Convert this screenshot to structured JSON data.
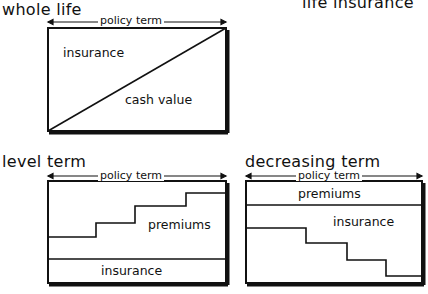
{
  "header": {
    "title": "life insurance"
  },
  "diagrams": [
    {
      "title": "whole life",
      "span_label": "policy term",
      "regions": [
        "insurance",
        "cash value"
      ]
    },
    {
      "title": "level term",
      "span_label": "policy term",
      "regions": [
        "premiums",
        "insurance"
      ]
    },
    {
      "title": "decreasing term",
      "span_label": "policy term",
      "regions": [
        "premiums",
        "insurance"
      ]
    }
  ]
}
